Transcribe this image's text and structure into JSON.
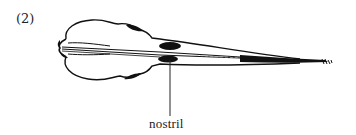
{
  "figure": {
    "panel_label": "(2)",
    "callouts": [
      {
        "label": "nostril"
      }
    ]
  }
}
